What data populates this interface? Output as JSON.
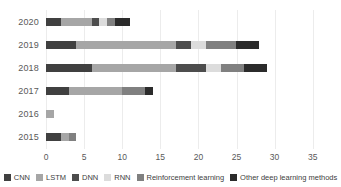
{
  "chart_data": {
    "type": "bar",
    "orientation": "horizontal",
    "stacked": true,
    "title": "",
    "xlabel": "",
    "ylabel": "",
    "xlim": [
      0,
      35
    ],
    "x_ticks": [
      0,
      5,
      10,
      15,
      20,
      25,
      30,
      35
    ],
    "grid": true,
    "legend_position": "bottom",
    "categories": [
      "2020",
      "2019",
      "2018",
      "2017",
      "2016",
      "2015"
    ],
    "series": [
      {
        "name": "CNN",
        "color": "#404040",
        "values": [
          2,
          4,
          6,
          3,
          0,
          2
        ]
      },
      {
        "name": "LSTM",
        "color": "#a6a6a6",
        "values": [
          4,
          13,
          11,
          7,
          1,
          1
        ]
      },
      {
        "name": "DNN",
        "color": "#4d4d4d",
        "values": [
          1,
          2,
          4,
          0,
          0,
          0
        ]
      },
      {
        "name": "RNN",
        "color": "#dcdcdc",
        "values": [
          1,
          2,
          2,
          0,
          0,
          0
        ]
      },
      {
        "name": "Reinforcement learning",
        "color": "#808080",
        "values": [
          1,
          4,
          3,
          3,
          0,
          1
        ]
      },
      {
        "name": "Other deep learning methods",
        "color": "#2b2b2b",
        "values": [
          2,
          3,
          3,
          1,
          0,
          0
        ]
      }
    ],
    "totals": {
      "2020": 11,
      "2019": 28,
      "2018": 29,
      "2017": 14,
      "2016": 1,
      "2015": 4
    }
  },
  "colors": {
    "background": "#ffffff",
    "gridline": "#ececec",
    "axis_text": "#595959",
    "legend_text": "#404040"
  }
}
